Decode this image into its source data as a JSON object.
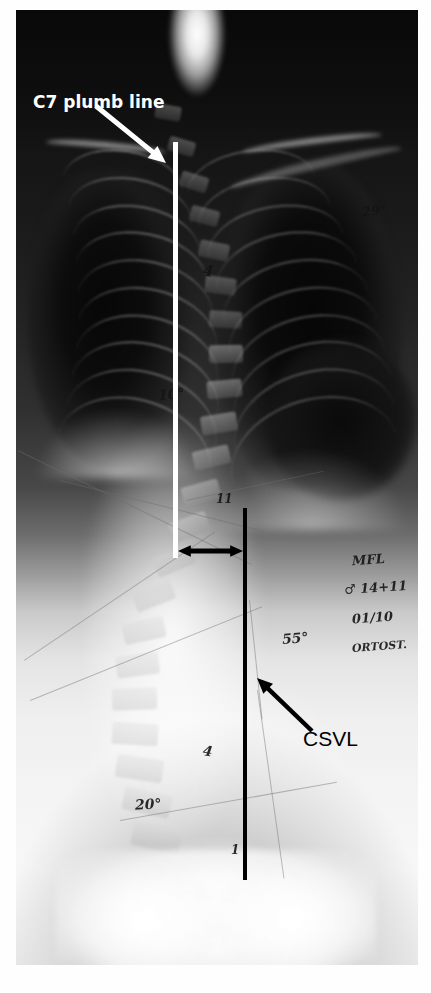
{
  "image": {
    "kind": "posteroanterior-spine-radiograph",
    "description": "Standing PA full-spine X-ray demonstrating scoliosis with coronal balance measurement",
    "plate": {
      "left": 16,
      "top": 10,
      "width": 402,
      "height": 955
    },
    "background_color": "#ffffff"
  },
  "annotations": {
    "plumb_label": {
      "text": "C7 plumb line",
      "color": "#ffffff",
      "x": 33,
      "y": 92
    },
    "csvl_label": {
      "text": "CSVL",
      "color": "#000000",
      "x": 303,
      "y": 727
    },
    "plumb_line": {
      "name": "C7 plumb line",
      "color": "#ffffff",
      "x": 175,
      "y_top": 142,
      "y_bottom": 558,
      "width": 5
    },
    "csvl_line": {
      "name": "Center Sacral Vertical Line",
      "color": "#000000",
      "x": 245,
      "y_top": 508,
      "y_bottom": 880,
      "width": 4
    },
    "offset_arrow": {
      "name": "coronal-balance-offset",
      "color": "#000000",
      "x_start": 178,
      "x_end": 243,
      "y": 551
    },
    "plumb_arrow": {
      "color": "#ffffff",
      "x_tail": 96,
      "y_tail": 106,
      "x_head": 166,
      "y_head": 163
    },
    "csvl_arrow": {
      "color": "#000000",
      "x_tail": 312,
      "y_tail": 731,
      "x_head": 257,
      "y_head": 678
    }
  },
  "film_markings": [
    {
      "text": "29°",
      "x": 362,
      "y": 203,
      "size": 13,
      "rot": -8,
      "tone": "dark"
    },
    {
      "text": "4",
      "x": 203,
      "y": 262,
      "size": 15,
      "rot": 6,
      "tone": "dark"
    },
    {
      "text": "10°",
      "x": 158,
      "y": 386,
      "size": 14,
      "rot": -4,
      "tone": "dark"
    },
    {
      "text": "11",
      "x": 216,
      "y": 492,
      "size": 12,
      "rot": 0,
      "tone": "dark"
    },
    {
      "text": "MFL",
      "x": 352,
      "y": 552,
      "size": 13,
      "rot": -4,
      "tone": "dark"
    },
    {
      "text": "♂ 14+11",
      "x": 344,
      "y": 580,
      "size": 13,
      "rot": -4,
      "tone": "dark"
    },
    {
      "text": "01/10",
      "x": 352,
      "y": 610,
      "size": 13,
      "rot": -4,
      "tone": "dark"
    },
    {
      "text": "ORTOST.",
      "x": 352,
      "y": 640,
      "size": 11,
      "rot": -4,
      "tone": "dark"
    },
    {
      "text": "55°",
      "x": 282,
      "y": 630,
      "size": 14,
      "rot": -4,
      "tone": "dark"
    },
    {
      "text": "4",
      "x": 203,
      "y": 743,
      "size": 14,
      "rot": 8,
      "tone": "dark"
    },
    {
      "text": "20°",
      "x": 135,
      "y": 796,
      "size": 14,
      "rot": -3,
      "tone": "dark"
    },
    {
      "text": "1",
      "x": 231,
      "y": 843,
      "size": 12,
      "rot": 0,
      "tone": "dark"
    }
  ]
}
